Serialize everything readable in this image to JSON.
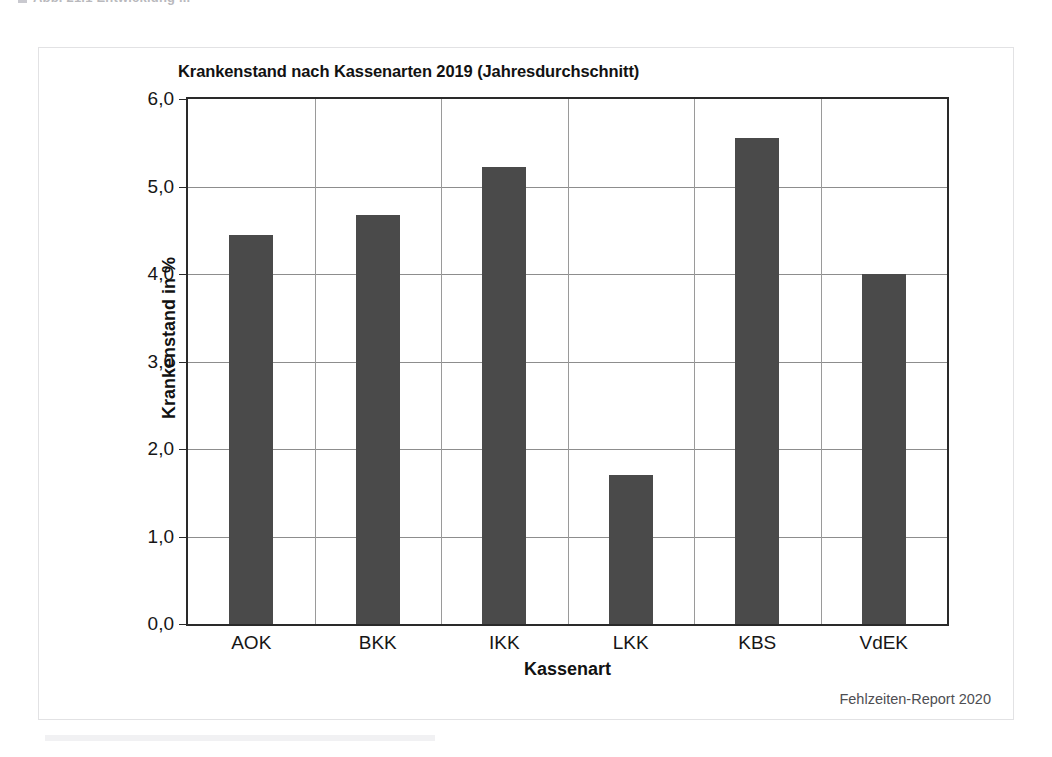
{
  "figure": {
    "caption_marker": "square-bullet",
    "caption_text": "Abb. 21.1  Entwicklung ...",
    "source_note": "Fehlzeiten-Report 2020"
  },
  "chart_data": {
    "type": "bar",
    "title": "Krankenstand nach Kassenarten 2019 (Jahresdurchschnitt)",
    "xlabel": "Kassenart",
    "ylabel": "Krankenstand in %",
    "categories": [
      "AOK",
      "BKK",
      "IKK",
      "LKK",
      "KBS",
      "VdEK"
    ],
    "values": [
      4.45,
      4.67,
      5.22,
      1.7,
      5.56,
      4.0
    ],
    "ylim": [
      0.0,
      6.0
    ],
    "ytick_labels": [
      "0,0",
      "1,0",
      "2,0",
      "3,0",
      "4,0",
      "5,0",
      "6,0"
    ],
    "ytick_values": [
      0.0,
      1.0,
      2.0,
      3.0,
      4.0,
      5.0,
      6.0
    ],
    "grid": "horizontal-and-vertical",
    "legend": "none",
    "bar_color": "#4a4a4a",
    "grid_color": "#8d8d8d",
    "axis_color": "#2a2a2a"
  }
}
